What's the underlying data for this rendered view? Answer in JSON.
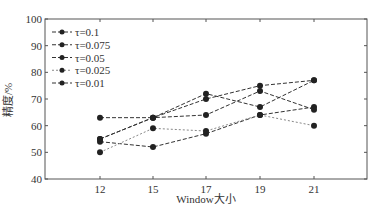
{
  "chart_data": {
    "type": "line",
    "title": "",
    "xlabel": "Window大小",
    "ylabel": "精度/%",
    "categories": [
      "12",
      "15",
      "17",
      "19",
      "21"
    ],
    "ylim": [
      40,
      100
    ],
    "yticks": [
      40,
      50,
      60,
      70,
      80,
      90,
      100
    ],
    "grid": false,
    "legend_position": "upper-left",
    "series": [
      {
        "name": "τ=0.1",
        "values": [
          63,
          63,
          72,
          67,
          77
        ],
        "color": "#333333",
        "dash": "4,2"
      },
      {
        "name": "τ=0.075",
        "values": [
          55,
          63,
          70,
          75,
          77
        ],
        "color": "#333333",
        "dash": "4,2"
      },
      {
        "name": "τ=0.05",
        "values": [
          54,
          52,
          57,
          64,
          67
        ],
        "color": "#333333",
        "dash": "4,2"
      },
      {
        "name": "τ=0.025",
        "values": [
          50,
          59,
          58,
          64,
          60
        ],
        "color": "#888888",
        "dash": "2,2"
      },
      {
        "name": "τ=0.01",
        "values": [
          55,
          63,
          64,
          73,
          66
        ],
        "color": "#333333",
        "dash": "4,2"
      }
    ]
  }
}
